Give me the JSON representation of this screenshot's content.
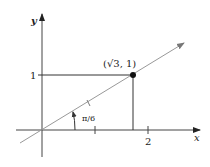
{
  "diagram": {
    "x_axis_label": "x",
    "y_axis_label": "y",
    "y_tick_label": "1",
    "x_tick_label": "2",
    "point_label": "(√3, 1)",
    "angle_label": "π/6",
    "colors": {
      "axes": "#333333",
      "line": "#888888",
      "point": "#111111"
    }
  }
}
